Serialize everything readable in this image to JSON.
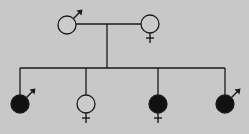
{
  "diagram": {
    "type": "pedigree",
    "background": "#c8c8c8",
    "line_color": "#1a1a1a",
    "affected_fill": "#111111",
    "unaffected_fill": "#cbcbcb",
    "parents": [
      {
        "sex": "male",
        "affected": false,
        "x": 67,
        "y": 25
      },
      {
        "sex": "female",
        "affected": false,
        "x": 150,
        "y": 24
      }
    ],
    "children": [
      {
        "sex": "male",
        "affected": true,
        "x": 20,
        "y": 104
      },
      {
        "sex": "female",
        "affected": false,
        "x": 86,
        "y": 104
      },
      {
        "sex": "female",
        "affected": true,
        "x": 158,
        "y": 104
      },
      {
        "sex": "male",
        "affected": true,
        "x": 225,
        "y": 104
      }
    ]
  }
}
